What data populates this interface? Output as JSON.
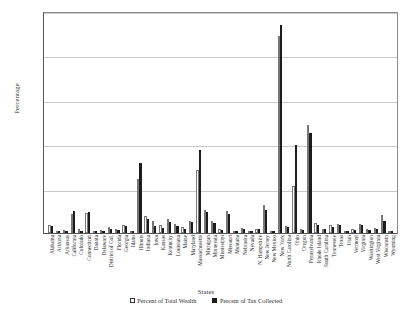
{
  "chart_data": {
    "type": "bar",
    "title": "",
    "xlabel": "States",
    "ylabel": "Percentage",
    "ylim": [
      0,
      25
    ],
    "yticks": [
      0,
      5,
      10,
      15,
      20,
      25
    ],
    "grid": true,
    "legend_position": "bottom",
    "categories": [
      "Alabama",
      "Arizona",
      "Arkansas",
      "California",
      "Colorado",
      "Connecticut",
      "Dakota",
      "Delaware",
      "District of Col.",
      "Florida",
      "Georgia",
      "Idaho",
      "Illinois",
      "Indiana",
      "Iowa",
      "Kansas",
      "Kentucky",
      "Louisiana",
      "Maine",
      "Maryland",
      "Massachusetts",
      "Michigan",
      "Minnesota",
      "Mississippi",
      "Missouri",
      "Montana",
      "Nebraska",
      "Nevada",
      "N. Hampshire",
      "New Jersey",
      "New Mexico",
      "New York",
      "North Carolina",
      "Ohio",
      "Oregon",
      "Pennsylvania",
      "Rhode Island",
      "South Carolina",
      "Tennessee",
      "Texas",
      "Utah",
      "Vermont",
      "Virginia",
      "Washington",
      "West Virginia",
      "Wisconsin",
      "Wyoming"
    ],
    "series": [
      {
        "name": "Percent of Total Wealth",
        "color": "#ffffff",
        "values": [
          0.9,
          0.2,
          0.3,
          2.1,
          0.4,
          2.2,
          0.1,
          0.3,
          0.7,
          0.4,
          0.9,
          0.1,
          6.1,
          1.9,
          1.3,
          0.9,
          1.6,
          1.0,
          0.7,
          1.4,
          7.1,
          2.6,
          1.3,
          0.4,
          2.5,
          0.2,
          0.6,
          0.1,
          0.5,
          3.1,
          0.1,
          22.2,
          0.8,
          5.3,
          0.4,
          12.2,
          1.1,
          0.5,
          0.9,
          1.0,
          0.2,
          0.4,
          1.0,
          0.4,
          0.6,
          2.0,
          0.1
        ]
      },
      {
        "name": "Percent of Tax Collected",
        "color": "#1c1c1c",
        "values": [
          0.8,
          0.1,
          0.2,
          2.5,
          0.2,
          2.4,
          0.1,
          0.2,
          0.5,
          0.3,
          0.8,
          0.1,
          7.9,
          1.6,
          0.8,
          0.6,
          1.2,
          0.8,
          0.5,
          1.2,
          9.3,
          2.4,
          1.1,
          0.3,
          2.1,
          0.2,
          0.5,
          0.1,
          0.4,
          2.6,
          0.1,
          23.4,
          0.7,
          9.9,
          0.3,
          11.3,
          0.9,
          0.4,
          0.7,
          0.9,
          0.1,
          0.3,
          0.9,
          0.3,
          0.5,
          1.4,
          0.1
        ]
      }
    ]
  },
  "legend": {
    "items": [
      {
        "label": "Percent of Total Wealth"
      },
      {
        "label": "Percent of  Tax Collected"
      }
    ]
  }
}
